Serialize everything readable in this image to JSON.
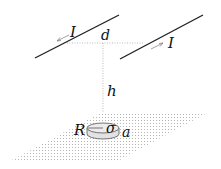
{
  "diagram": {
    "labels": {
      "current_left": "I",
      "current_right": "I",
      "separation": "d",
      "height": "h",
      "disk_radius": "R",
      "charge_density": "σ",
      "thickness": "a"
    },
    "colors": {
      "wire": "#222222",
      "dotted": "#aaaaaa",
      "plane": "#bbbbbb",
      "disk_fill": "#e6e6e6",
      "disk_stroke": "#555555",
      "arrow": "#888888"
    }
  }
}
